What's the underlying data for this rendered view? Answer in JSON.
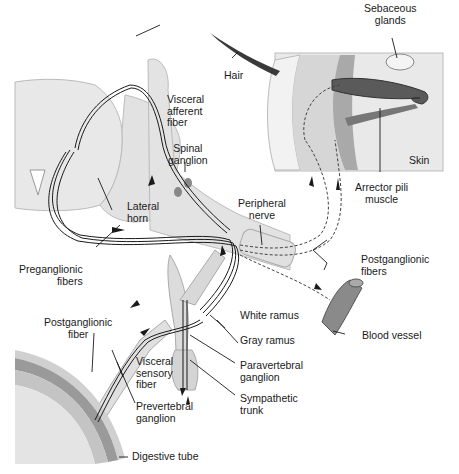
{
  "diagram": {
    "labels": {
      "sebaceous_glands": "Sebaceous\nglands",
      "hair": "Hair",
      "skin": "Skin",
      "arrector_pili_muscle": "Arrector pili\nmuscle",
      "visceral_afferent_fiber": "Visceral\nafferent\nfiber",
      "spinal_ganglion": "Spinal\nganglion",
      "lateral_horn": "Lateral\nhorn",
      "peripheral_nerve": "Peripheral\nnerve",
      "preganglionic_fibers": "Preganglionic\nfibers",
      "postganglionic_fibers": "Postganglionic\nfibers",
      "white_ramus": "White ramus",
      "gray_ramus": "Gray ramus",
      "blood_vessel": "Blood vessel",
      "postganglionic_fiber": "Postganglionic\nfiber",
      "visceral_sensory_fiber": "Visceral\nsensory\nfiber",
      "paravertebral_ganglion": "Paravertebral\nganglion",
      "prevertebral_ganglion": "Prevertebral\nganglion",
      "sympathetic_trunk": "Sympathetic\ntrunk",
      "digestive_tube": "Digestive tube"
    },
    "colors": {
      "tissue_light": "#e6e6e6",
      "tissue_mid": "#cfcfcf",
      "tissue_dark": "#8a8a8a",
      "hair": "#3a3a3a",
      "line": "#1a1a1a"
    }
  }
}
